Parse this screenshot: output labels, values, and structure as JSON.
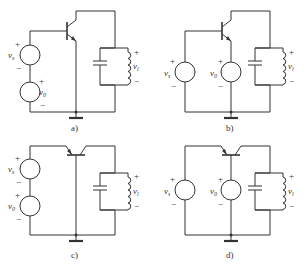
{
  "figure": {
    "panels": [
      {
        "id": "a",
        "caption": "a)",
        "sources": [
          {
            "name": "v",
            "sub": "s"
          },
          {
            "name": "v",
            "sub": "0"
          }
        ],
        "output": {
          "name": "v",
          "sub": "l"
        },
        "configuration": "common-emitter, series sources at base"
      },
      {
        "id": "b",
        "caption": "b)",
        "sources": [
          {
            "name": "v",
            "sub": "s"
          },
          {
            "name": "v",
            "sub": "0"
          }
        ],
        "output": {
          "name": "v",
          "sub": "l"
        },
        "configuration": "v_s at base, v_0 at emitter"
      },
      {
        "id": "c",
        "caption": "c)",
        "sources": [
          {
            "name": "v",
            "sub": "s"
          },
          {
            "name": "v",
            "sub": "0"
          }
        ],
        "output": {
          "name": "v",
          "sub": "l"
        },
        "configuration": "common-base, series sources at emitter"
      },
      {
        "id": "d",
        "caption": "d)",
        "sources": [
          {
            "name": "v",
            "sub": "s"
          },
          {
            "name": "v",
            "sub": "0"
          }
        ],
        "output": {
          "name": "v",
          "sub": "l"
        },
        "configuration": "v_s at emitter, v_0 at base"
      }
    ],
    "plus": "+",
    "minus": "−"
  }
}
